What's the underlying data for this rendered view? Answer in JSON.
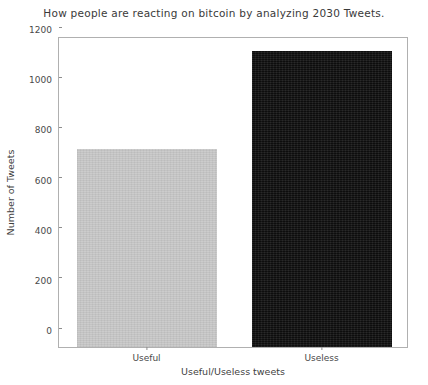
{
  "chart_data": {
    "type": "bar",
    "title": "How people are reacting on bitcoin by analyzing 2030 Tweets.",
    "xlabel": "Useful/Useless tweets",
    "ylabel": "Number of Tweets",
    "categories": [
      "Useful",
      "Useless"
    ],
    "values": [
      790,
      1180
    ],
    "series": [
      {
        "name": "Tweets",
        "values": [
          790,
          1180
        ]
      }
    ],
    "bars": [
      {
        "category": "Useful",
        "value": 790,
        "color": "#c9c9c9"
      },
      {
        "category": "Useless",
        "value": 1180,
        "color": "#141414"
      }
    ],
    "ylim": [
      0,
      1240
    ],
    "yticks": [
      0,
      200,
      400,
      600,
      800,
      1000,
      1200
    ],
    "ytick_labels": [
      "0",
      "200",
      "400",
      "600",
      "800",
      "1000",
      "1200"
    ],
    "xticks": [
      "Useful",
      "Useless"
    ],
    "grid": false,
    "legend": null,
    "legend_position": "none",
    "axis_color": "#b0b0b0",
    "tick_color": "#8d8d8d",
    "text_color": "#3a3a3a",
    "background": "#ffffff"
  }
}
